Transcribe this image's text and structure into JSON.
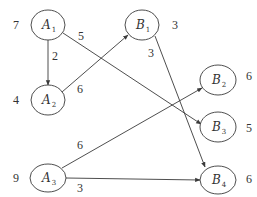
{
  "diagram": {
    "type": "directed-network",
    "nodes": [
      {
        "id": "A1",
        "letter": "A",
        "sub": "1",
        "cx": 48,
        "cy": 25,
        "rx": 17,
        "ry": 15,
        "weight": "7",
        "wx": 13,
        "wy": 29
      },
      {
        "id": "A2",
        "letter": "A",
        "sub": "2",
        "cx": 48,
        "cy": 100,
        "rx": 17,
        "ry": 15,
        "weight": "4",
        "wx": 13,
        "wy": 104
      },
      {
        "id": "A3",
        "letter": "A",
        "sub": "3",
        "cx": 48,
        "cy": 178,
        "rx": 18,
        "ry": 14,
        "weight": "9",
        "wx": 13,
        "wy": 182
      },
      {
        "id": "B1",
        "letter": "B",
        "sub": "1",
        "cx": 142,
        "cy": 25,
        "rx": 17,
        "ry": 15,
        "weight": "3",
        "wx": 172,
        "wy": 29
      },
      {
        "id": "B2",
        "letter": "B",
        "sub": "2",
        "cx": 218,
        "cy": 80,
        "rx": 18,
        "ry": 15,
        "weight": "6",
        "wx": 246,
        "wy": 80
      },
      {
        "id": "B3",
        "letter": "B",
        "sub": "3",
        "cx": 218,
        "cy": 127,
        "rx": 18,
        "ry": 15,
        "weight": "5",
        "wx": 246,
        "wy": 132
      },
      {
        "id": "B4",
        "letter": "B",
        "sub": "4",
        "cx": 218,
        "cy": 180,
        "rx": 18,
        "ry": 14,
        "weight": "6",
        "wx": 246,
        "wy": 183
      }
    ],
    "edges": [
      {
        "from": "A1",
        "to": "A2",
        "label": "2",
        "x1": 48,
        "y1": 40,
        "x2": 48,
        "y2": 85,
        "lx": 52,
        "ly": 60
      },
      {
        "from": "A1",
        "to": "B3",
        "label": "5",
        "x1": 63,
        "y1": 33,
        "x2": 201,
        "y2": 124,
        "lx": 78,
        "ly": 40
      },
      {
        "from": "A2",
        "to": "B1",
        "label": "6",
        "x1": 62,
        "y1": 92,
        "x2": 128,
        "y2": 35,
        "lx": 77,
        "ly": 93
      },
      {
        "from": "B1",
        "to": "B4",
        "label": "3",
        "x1": 155,
        "y1": 36,
        "x2": 205,
        "y2": 167,
        "lx": 148,
        "ly": 57
      },
      {
        "from": "A3",
        "to": "B2",
        "label": "6",
        "x1": 62,
        "y1": 168,
        "x2": 202,
        "y2": 88,
        "lx": 77,
        "ly": 149
      },
      {
        "from": "A3",
        "to": "B4",
        "label": "3",
        "x1": 66,
        "y1": 178,
        "x2": 200,
        "y2": 180,
        "lx": 77,
        "ly": 192
      }
    ]
  }
}
